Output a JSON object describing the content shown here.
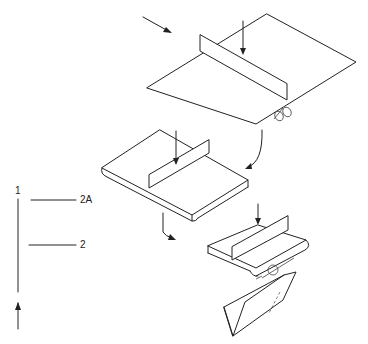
{
  "figure": {
    "type": "patent-style exploded assembly diagram",
    "labels": [
      {
        "id": "label-1",
        "text": "1"
      },
      {
        "id": "label-2A",
        "text": "2A"
      },
      {
        "id": "label-2",
        "text": "2"
      }
    ],
    "components": [
      "feed-direction-arrow",
      "large-sheet-with-fold-blade",
      "fold-rollers",
      "first-folded-sheet-with-blade",
      "second-folded-sheet-with-blade",
      "fold-detail-circle",
      "final-folded-product"
    ],
    "colors": {
      "stroke": "#222222",
      "background": "#ffffff"
    }
  }
}
